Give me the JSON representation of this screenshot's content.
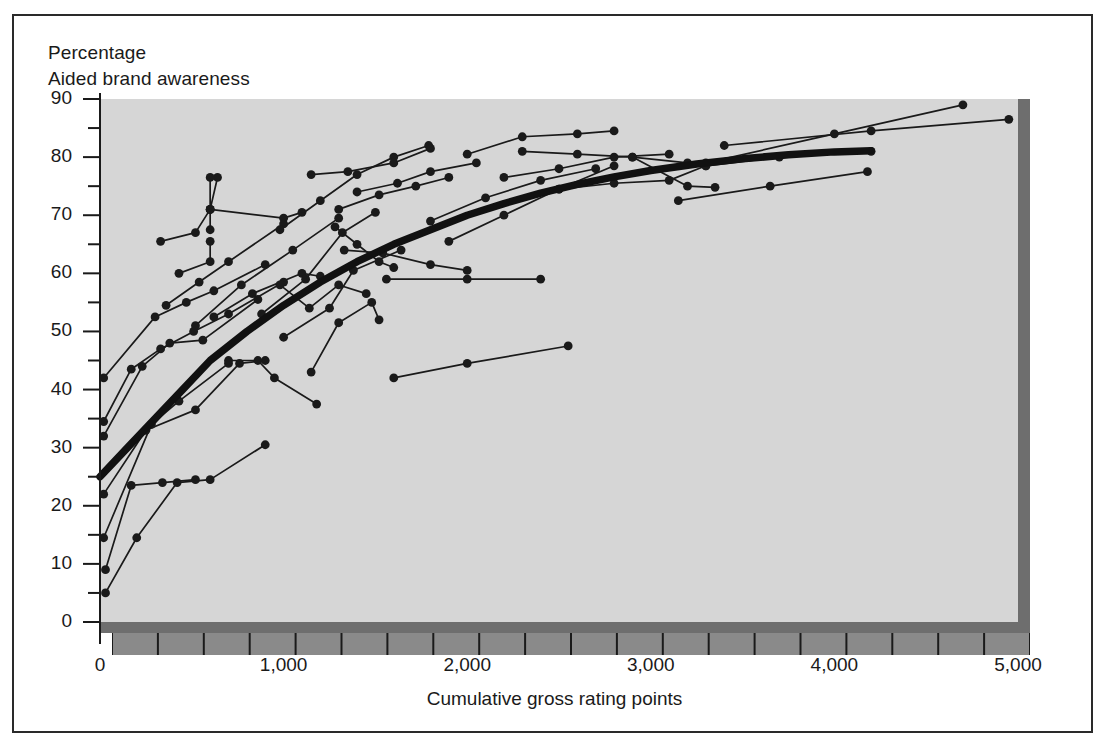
{
  "figure": {
    "title_line1": "Percentage",
    "title_line2": "Aided brand awareness",
    "xtitle": "Cumulative gross rating points",
    "plot_bg": "#d6d6d6",
    "shadow": "#6e6e6e",
    "axis_band": "#8a8a8a",
    "ink": "#1a1a1a"
  },
  "chart_data": {
    "type": "scatter",
    "title": "Aided brand awareness",
    "subtitle": "Percentage",
    "xlabel": "Cumulative gross rating points",
    "ylabel": "Percentage",
    "xlim": [
      0,
      5000
    ],
    "ylim": [
      0,
      90
    ],
    "xticks": [
      0,
      1000,
      2000,
      3000,
      4000,
      5000
    ],
    "xtick_labels": [
      "0",
      "1,000",
      "2,000",
      "3,000",
      "4,000",
      "5,000"
    ],
    "x_minor_step": 250,
    "yticks": [
      0,
      10,
      20,
      30,
      40,
      50,
      60,
      70,
      80,
      90
    ],
    "ytick_labels": [
      "0",
      "10",
      "20",
      "30",
      "40",
      "50",
      "60",
      "70",
      "80",
      "90"
    ],
    "y_minor_step": 5,
    "grid": false,
    "legend": null,
    "marker": "filled-circle",
    "average_curve": {
      "name": "Average response curve",
      "style": "thick-solid",
      "points": [
        [
          0,
          25
        ],
        [
          150,
          30
        ],
        [
          300,
          35
        ],
        [
          450,
          40
        ],
        [
          600,
          45
        ],
        [
          800,
          50
        ],
        [
          1000,
          54.5
        ],
        [
          1200,
          58.5
        ],
        [
          1400,
          62
        ],
        [
          1600,
          65
        ],
        [
          1800,
          67.5
        ],
        [
          2000,
          70
        ],
        [
          2200,
          72
        ],
        [
          2400,
          73.8
        ],
        [
          2600,
          75.3
        ],
        [
          2800,
          76.6
        ],
        [
          3000,
          77.7
        ],
        [
          3250,
          78.8
        ],
        [
          3500,
          79.7
        ],
        [
          3750,
          80.4
        ],
        [
          4000,
          80.9
        ],
        [
          4200,
          81.1
        ]
      ]
    },
    "series": [
      {
        "name": "brand-01",
        "points": [
          [
            30,
            5
          ],
          [
            200,
            14.5
          ],
          [
            420,
            24
          ],
          [
            600,
            24.5
          ],
          [
            900,
            30.5
          ]
        ]
      },
      {
        "name": "brand-02",
        "points": [
          [
            30,
            9
          ],
          [
            170,
            23.5
          ],
          [
            340,
            24
          ],
          [
            520,
            24.5
          ]
        ]
      },
      {
        "name": "brand-03",
        "points": [
          [
            20,
            14.5
          ],
          [
            280,
            34
          ],
          [
            430,
            38
          ],
          [
            700,
            44.5
          ]
        ]
      },
      {
        "name": "brand-04",
        "points": [
          [
            20,
            22
          ],
          [
            250,
            33
          ],
          [
            520,
            36.5
          ],
          [
            760,
            44.5
          ],
          [
            900,
            45
          ]
        ]
      },
      {
        "name": "brand-05",
        "points": [
          [
            20,
            32
          ],
          [
            230,
            44
          ],
          [
            380,
            48
          ],
          [
            560,
            48.5
          ],
          [
            860,
            55.5
          ]
        ]
      },
      {
        "name": "brand-06",
        "points": [
          [
            20,
            34.5
          ],
          [
            170,
            43.5
          ],
          [
            330,
            47
          ],
          [
            510,
            50
          ],
          [
            700,
            53
          ],
          [
            1000,
            58.5
          ]
        ]
      },
      {
        "name": "brand-07",
        "points": [
          [
            20,
            42
          ],
          [
            300,
            52.5
          ],
          [
            470,
            55
          ],
          [
            620,
            57
          ],
          [
            900,
            61.5
          ]
        ]
      },
      {
        "name": "brand-08",
        "points": [
          [
            330,
            65.5
          ],
          [
            520,
            67
          ],
          [
            600,
            71
          ],
          [
            640,
            76.5
          ]
        ]
      },
      {
        "name": "brand-09",
        "points": [
          [
            600,
            71
          ],
          [
            1000,
            69.5
          ],
          [
            1100,
            70.5
          ]
        ]
      },
      {
        "name": "brand-10",
        "points": [
          [
            600,
            67.5
          ],
          [
            600,
            71
          ],
          [
            600,
            76.5
          ]
        ]
      },
      {
        "name": "brand-11",
        "points": [
          [
            430,
            60
          ],
          [
            600,
            62
          ],
          [
            600,
            65.5
          ]
        ]
      },
      {
        "name": "brand-12",
        "points": [
          [
            360,
            54.5
          ],
          [
            540,
            58.5
          ],
          [
            700,
            62
          ],
          [
            1000,
            68.5
          ]
        ]
      },
      {
        "name": "brand-13",
        "points": [
          [
            520,
            51
          ],
          [
            770,
            58
          ],
          [
            1050,
            64
          ],
          [
            1300,
            69.5
          ]
        ]
      },
      {
        "name": "brand-14",
        "points": [
          [
            620,
            52.5
          ],
          [
            830,
            56.5
          ],
          [
            1100,
            60
          ],
          [
            1200,
            59.5
          ]
        ]
      },
      {
        "name": "brand-15",
        "points": [
          [
            700,
            45
          ],
          [
            860,
            45
          ],
          [
            950,
            42
          ],
          [
            1180,
            37.5
          ]
        ]
      },
      {
        "name": "brand-16",
        "points": [
          [
            980,
            58
          ],
          [
            1140,
            54
          ],
          [
            1300,
            58
          ],
          [
            1450,
            56.5
          ]
        ]
      },
      {
        "name": "brand-17",
        "points": [
          [
            880,
            53
          ],
          [
            1120,
            59
          ],
          [
            1320,
            67
          ],
          [
            1500,
            70.5
          ]
        ]
      },
      {
        "name": "brand-18",
        "points": [
          [
            1150,
            43
          ],
          [
            1300,
            51.5
          ],
          [
            1480,
            55
          ],
          [
            1520,
            52
          ]
        ]
      },
      {
        "name": "brand-19",
        "points": [
          [
            1000,
            49
          ],
          [
            1250,
            54
          ],
          [
            1380,
            60.5
          ],
          [
            1640,
            64
          ]
        ]
      },
      {
        "name": "brand-20",
        "points": [
          [
            980,
            67.5
          ],
          [
            1200,
            72.5
          ],
          [
            1400,
            77
          ],
          [
            1600,
            80
          ],
          [
            1790,
            82
          ]
        ]
      },
      {
        "name": "brand-21",
        "points": [
          [
            1150,
            77
          ],
          [
            1350,
            77.5
          ],
          [
            1600,
            79
          ],
          [
            1800,
            81.5
          ]
        ]
      },
      {
        "name": "brand-22",
        "points": [
          [
            1300,
            71
          ],
          [
            1520,
            73.5
          ],
          [
            1720,
            75
          ],
          [
            1900,
            76.5
          ]
        ]
      },
      {
        "name": "brand-23",
        "points": [
          [
            1280,
            68
          ],
          [
            1400,
            65
          ],
          [
            1520,
            62
          ],
          [
            1600,
            61
          ]
        ]
      },
      {
        "name": "brand-24",
        "points": [
          [
            1400,
            74
          ],
          [
            1620,
            75.5
          ],
          [
            1800,
            77.5
          ],
          [
            2050,
            79
          ]
        ]
      },
      {
        "name": "brand-25",
        "points": [
          [
            1330,
            64
          ],
          [
            1540,
            63.5
          ],
          [
            1800,
            61.5
          ],
          [
            2000,
            60.5
          ]
        ]
      },
      {
        "name": "brand-26",
        "points": [
          [
            1600,
            42
          ],
          [
            2000,
            44.5
          ],
          [
            2550,
            47.5
          ]
        ]
      },
      {
        "name": "brand-27",
        "points": [
          [
            1560,
            59
          ],
          [
            2000,
            59
          ],
          [
            2400,
            59
          ]
        ]
      },
      {
        "name": "brand-28",
        "points": [
          [
            1800,
            69
          ],
          [
            2100,
            73
          ],
          [
            2400,
            76
          ],
          [
            2700,
            78
          ]
        ]
      },
      {
        "name": "brand-29",
        "points": [
          [
            1900,
            65.5
          ],
          [
            2200,
            70
          ],
          [
            2500,
            74.5
          ],
          [
            2800,
            78.5
          ]
        ]
      },
      {
        "name": "brand-30",
        "points": [
          [
            2000,
            80.5
          ],
          [
            2300,
            83.5
          ],
          [
            2600,
            84
          ],
          [
            2800,
            84.5
          ]
        ]
      },
      {
        "name": "brand-31",
        "points": [
          [
            2200,
            76.5
          ],
          [
            2500,
            78
          ],
          [
            2800,
            80
          ],
          [
            3100,
            80.5
          ]
        ]
      },
      {
        "name": "brand-32",
        "points": [
          [
            2300,
            81
          ],
          [
            2600,
            80.5
          ],
          [
            2900,
            80
          ],
          [
            3200,
            79
          ]
        ]
      },
      {
        "name": "brand-33",
        "points": [
          [
            2500,
            74.5
          ],
          [
            2800,
            75.5
          ],
          [
            3100,
            76
          ],
          [
            3300,
            78.5
          ]
        ]
      },
      {
        "name": "brand-34",
        "points": [
          [
            2900,
            80
          ],
          [
            3200,
            75
          ],
          [
            3350,
            74.8
          ]
        ]
      },
      {
        "name": "brand-35",
        "points": [
          [
            3300,
            78.5
          ],
          [
            3700,
            80
          ],
          [
            4200,
            81
          ]
        ]
      },
      {
        "name": "brand-36",
        "points": [
          [
            3150,
            72.5
          ],
          [
            3650,
            75
          ],
          [
            4180,
            77.5
          ]
        ]
      },
      {
        "name": "brand-37",
        "points": [
          [
            3300,
            79
          ],
          [
            4000,
            84
          ],
          [
            4700,
            89
          ]
        ]
      },
      {
        "name": "brand-38",
        "points": [
          [
            3400,
            82
          ],
          [
            4200,
            84.5
          ],
          [
            4950,
            86.5
          ]
        ]
      }
    ]
  }
}
